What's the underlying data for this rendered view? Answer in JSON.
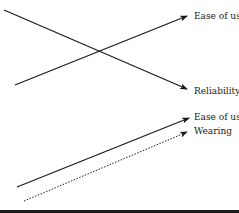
{
  "diagram": {
    "top_panel": {
      "arrows": [
        {
          "label": "Ease of use",
          "style": "solid",
          "direction": "increasing"
        },
        {
          "label": "Reliability",
          "style": "solid",
          "direction": "decreasing"
        }
      ]
    },
    "bottom_panel": {
      "arrows": [
        {
          "label": "Ease of use",
          "style": "solid",
          "direction": "increasing"
        },
        {
          "label": "Wearing",
          "style": "dotted",
          "direction": "increasing"
        }
      ]
    },
    "colors": {
      "line": "#1a1a1a",
      "background": "#ffffff",
      "bottom_bar": "#1e1e1e"
    }
  }
}
